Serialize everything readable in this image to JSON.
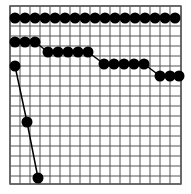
{
  "figure": {
    "background_color": "#ffffff",
    "width": 191,
    "height": 194
  },
  "chart_data": {
    "type": "line",
    "title": "",
    "subtitle": "",
    "xlabel": "",
    "ylabel": "",
    "grid": true,
    "grid_color": "#555555",
    "grid_linewidth": 1,
    "legend": false,
    "legend_position": "none",
    "marker": "circle",
    "marker_color": "#000000",
    "marker_size": 11,
    "line_color": "#000000",
    "line_width": 1.5,
    "axis_box": true,
    "axis_box_color": "#555555",
    "plot_area": {
      "x0": 10,
      "y0": 6,
      "x1": 181,
      "y1": 184
    },
    "cell_size": 10,
    "x_ticks": [
      10,
      20,
      30,
      40,
      50,
      60,
      70,
      80,
      90,
      100,
      110,
      120,
      130,
      140,
      150,
      160,
      170,
      181
    ],
    "y_ticks": [
      6,
      16,
      26,
      36,
      46,
      56,
      66,
      76,
      86,
      96,
      106,
      116,
      126,
      136,
      146,
      156,
      166,
      176,
      184
    ],
    "xlim": [
      0,
      17
    ],
    "ylim": [
      0,
      17.8
    ],
    "tick_labels_visible": false,
    "series": [
      {
        "name": "series-1",
        "description": "flat top row of markers",
        "points_px": [
          [
            15,
            18
          ],
          [
            25,
            18
          ],
          [
            35,
            18
          ],
          [
            45,
            18
          ],
          [
            55,
            18
          ],
          [
            65,
            18
          ],
          [
            75,
            18
          ],
          [
            85,
            18
          ],
          [
            95,
            18
          ],
          [
            105,
            18
          ],
          [
            115,
            18
          ],
          [
            125,
            18
          ],
          [
            135,
            18
          ],
          [
            145,
            18
          ],
          [
            155,
            18
          ],
          [
            165,
            18
          ],
          [
            175,
            18
          ]
        ]
      },
      {
        "name": "series-2",
        "description": "descending stepped curve",
        "points_px": [
          [
            15,
            42
          ],
          [
            25,
            42
          ],
          [
            35,
            42
          ],
          [
            48,
            52
          ],
          [
            58,
            52
          ],
          [
            68,
            52
          ],
          [
            78,
            52
          ],
          [
            88,
            52
          ],
          [
            104,
            64
          ],
          [
            114,
            64
          ],
          [
            124,
            64
          ],
          [
            134,
            64
          ],
          [
            144,
            64
          ],
          [
            160,
            76
          ],
          [
            170,
            76
          ],
          [
            179,
            76
          ]
        ]
      },
      {
        "name": "series-3",
        "description": "steep descending three-point curve",
        "points_px": [
          [
            15,
            66
          ],
          [
            27,
            122
          ],
          [
            38,
            178
          ]
        ]
      }
    ]
  }
}
